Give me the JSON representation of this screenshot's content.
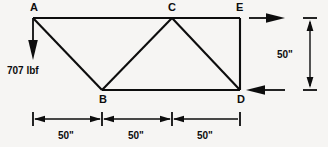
{
  "figure": {
    "background_color": "#f6f5f3",
    "line_color": "#0d0d0d"
  },
  "nodes": [
    {
      "id": "A",
      "label": "A",
      "x": 33,
      "y": 18,
      "label_x": 30,
      "label_y": 11
    },
    {
      "id": "B",
      "label": "B",
      "x": 102,
      "y": 90,
      "label_x": 99,
      "label_y": 103
    },
    {
      "id": "C",
      "label": "C",
      "x": 172,
      "y": 18,
      "label_x": 168,
      "label_y": 11
    },
    {
      "id": "D",
      "label": "D",
      "x": 240,
      "y": 90,
      "label_x": 237,
      "label_y": 103
    },
    {
      "id": "E",
      "label": "E",
      "x": 240,
      "y": 18,
      "label_x": 236,
      "label_y": 11
    }
  ],
  "members": [
    {
      "name": "top-chord-A-E",
      "from": "A",
      "to": "E"
    },
    {
      "name": "bottom-chord-B-D",
      "from": "B",
      "to": "D"
    },
    {
      "name": "diagonal-A-B",
      "from": "A",
      "to": "B"
    },
    {
      "name": "diagonal-B-C",
      "from": "B",
      "to": "C"
    },
    {
      "name": "diagonal-C-D",
      "from": "C",
      "to": "D"
    },
    {
      "name": "vertical-E-D",
      "from": "E",
      "to": "D"
    }
  ],
  "forces": [
    {
      "name": "applied-load-at-A",
      "label": "707  lbf",
      "magnitude": 707,
      "unit": "lbf",
      "direction": "down",
      "at_node": "A",
      "label_x": 7,
      "label_y": 74
    },
    {
      "name": "reaction-at-E",
      "label": "",
      "direction": "right",
      "at_node": "E"
    },
    {
      "name": "reaction-at-D",
      "label": "",
      "direction": "left",
      "at_node": "D"
    }
  ],
  "dimensions": {
    "horizontal": [
      {
        "name": "span-A-B",
        "label": "50\"",
        "value": 50,
        "unit": "in",
        "x1": 33,
        "x2": 102,
        "label_x": 67,
        "label_y": 139
      },
      {
        "name": "span-B-C",
        "label": "50\"",
        "value": 50,
        "unit": "in",
        "x1": 102,
        "x2": 172,
        "label_x": 137,
        "label_y": 139
      },
      {
        "name": "span-C-D",
        "label": "50\"",
        "value": 50,
        "unit": "in",
        "x1": 172,
        "x2": 240,
        "label_x": 206,
        "label_y": 139
      }
    ],
    "vertical": [
      {
        "name": "height-E-D",
        "label": "50\"",
        "value": 50,
        "unit": "in",
        "y1": 18,
        "y2": 90,
        "label_x": 291,
        "label_y": 58
      }
    ]
  }
}
